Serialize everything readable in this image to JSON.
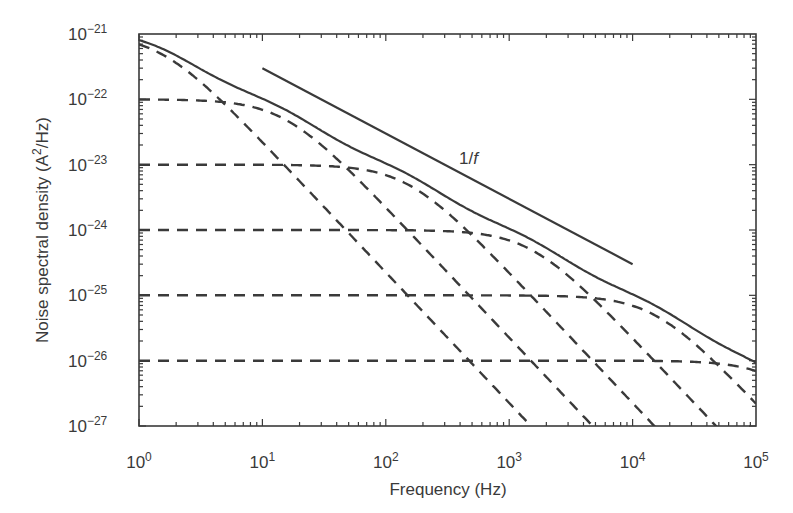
{
  "chart_data": {
    "type": "line",
    "title": "",
    "xlabel": "Frequency (Hz)",
    "ylabel_parts": {
      "pre": "Noise spectral density (A",
      "sup": "2",
      "post": "/Hz)"
    },
    "xscale": "log",
    "yscale": "log",
    "xlim": [
      1,
      100000
    ],
    "ylim": [
      1e-27,
      1e-21
    ],
    "grid": false,
    "legend": null,
    "x_ticks": [
      {
        "value": 1,
        "base": "10",
        "exp": "0"
      },
      {
        "value": 10,
        "base": "10",
        "exp": "1"
      },
      {
        "value": 100,
        "base": "10",
        "exp": "2"
      },
      {
        "value": 1000,
        "base": "10",
        "exp": "3"
      },
      {
        "value": 10000,
        "base": "10",
        "exp": "4"
      },
      {
        "value": 100000,
        "base": "10",
        "exp": "5"
      }
    ],
    "y_ticks": [
      {
        "value": 1e-21,
        "base": "10",
        "exp": "−21"
      },
      {
        "value": 1e-22,
        "base": "10",
        "exp": "−22"
      },
      {
        "value": 1e-23,
        "base": "10",
        "exp": "−23"
      },
      {
        "value": 1e-24,
        "base": "10",
        "exp": "−24"
      },
      {
        "value": 1e-25,
        "base": "10",
        "exp": "−25"
      },
      {
        "value": 1e-26,
        "base": "10",
        "exp": "−26"
      },
      {
        "value": 1e-27,
        "base": "10",
        "exp": "−27"
      }
    ],
    "lorentzian_components": [
      {
        "name": "Lorentzian 1",
        "plateau": 1e-21,
        "corner_hz": 1.5,
        "style": "dashed"
      },
      {
        "name": "Lorentzian 2",
        "plateau": 1e-22,
        "corner_hz": 15,
        "style": "dashed"
      },
      {
        "name": "Lorentzian 3",
        "plateau": 1e-23,
        "corner_hz": 150,
        "style": "dashed"
      },
      {
        "name": "Lorentzian 4",
        "plateau": 1e-24,
        "corner_hz": 1500,
        "style": "dashed"
      },
      {
        "name": "Lorentzian 5",
        "plateau": 1e-25,
        "corner_hz": 15000,
        "style": "dashed"
      },
      {
        "name": "Lorentzian 6",
        "plateau": 1e-26,
        "corner_hz": 150000,
        "style": "dashed"
      }
    ],
    "series": [
      {
        "name": "Sum of Lorentzians (total noise)",
        "style": "solid",
        "x": [
          1,
          10,
          100,
          1000,
          10000,
          100000
        ],
        "values": [
          7.1e-22,
          1e-22,
          1e-23,
          1e-24,
          1e-25,
          9.7e-27
        ]
      },
      {
        "name": "1/f reference",
        "style": "solid",
        "x": [
          10,
          10000
        ],
        "values": [
          3e-22,
          3e-25
        ]
      }
    ],
    "annotations": [
      {
        "text": "1/f",
        "x": 2000,
        "y": 2.2e-23,
        "italic_part": "f"
      }
    ]
  }
}
